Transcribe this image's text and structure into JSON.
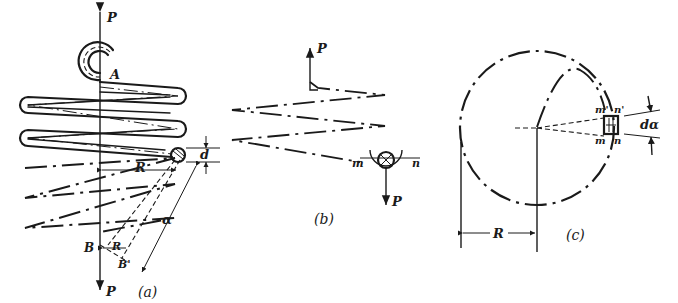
{
  "figure": {
    "panels": [
      {
        "id": "a",
        "caption": "(a)",
        "labels": {
          "force_top": "P",
          "force_bottom": "P",
          "point_a": "A",
          "point_b": "B",
          "point_b_prime": "B'",
          "radius": "R",
          "radius_lower": "R",
          "wire_diameter": "d",
          "helix_angle": "α"
        }
      },
      {
        "id": "b",
        "caption": "(b)",
        "labels": {
          "force_top": "P",
          "force_bottom": "P",
          "section_left": "m",
          "section_right": "n"
        }
      },
      {
        "id": "c",
        "caption": "(c)",
        "labels": {
          "radius": "R",
          "element_top_left": "m'",
          "element_top_right": "n'",
          "element_bottom_left": "m",
          "element_bottom_right": "n",
          "angle": "dα"
        }
      }
    ]
  }
}
